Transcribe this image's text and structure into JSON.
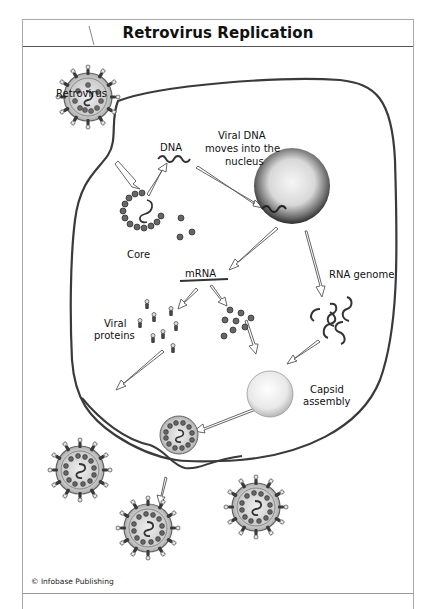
{
  "figure": {
    "title": "Retrovirus Replication",
    "credit": "© Infobase Publishing",
    "colors": {
      "border": "#a8a8a8",
      "title_divider": "#555555",
      "membrane": "#3a3a3a",
      "arrow_fill": "#ffffff",
      "arrow_stroke": "#555555",
      "capsid_bead": "#5a5a5a",
      "nucleus_dark": "#2a2a2a",
      "nucleus_light": "#f4f4f4"
    },
    "labels": {
      "retrovirus": "Retrovirus",
      "dna": "DNA",
      "viral_dna_line1": "Viral DNA",
      "viral_dna_line2": "moves into the",
      "viral_dna_line3": "nucleus",
      "core": "Core",
      "mrna": "mRNA",
      "rna_genome": "RNA genome",
      "viral_proteins_line1": "Viral",
      "viral_proteins_line2": "proteins",
      "capsid_line1": "Capsid",
      "capsid_line2": "assembly"
    }
  }
}
